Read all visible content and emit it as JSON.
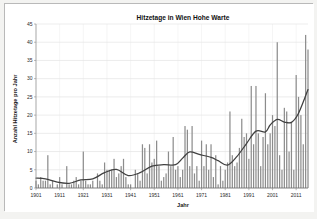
{
  "chart_data": {
    "type": "bar",
    "title": "Hitzetage in Wien Hohe Warte",
    "xlabel": "Jahr",
    "ylabel": "Anzahl Hitzetage pro Jahr",
    "ylim": [
      0,
      45
    ],
    "yticks": [
      0,
      5,
      10,
      15,
      20,
      25,
      30,
      35,
      40,
      45
    ],
    "xlim": [
      1901,
      2016
    ],
    "xticks": [
      1901,
      1911,
      1921,
      1931,
      1941,
      1951,
      1961,
      1971,
      1981,
      1991,
      2001,
      2011
    ],
    "grid": true,
    "legend": null,
    "bar_color": "#8c8c8c",
    "trend_color": "#404040",
    "series": [
      {
        "name": "Hitzetage pro Jahr",
        "type": "bar",
        "x": [
          1901,
          1902,
          1903,
          1904,
          1905,
          1906,
          1907,
          1908,
          1909,
          1910,
          1911,
          1912,
          1913,
          1914,
          1915,
          1916,
          1917,
          1918,
          1919,
          1920,
          1921,
          1922,
          1923,
          1924,
          1925,
          1926,
          1927,
          1928,
          1929,
          1930,
          1931,
          1932,
          1933,
          1934,
          1935,
          1936,
          1937,
          1938,
          1939,
          1940,
          1941,
          1942,
          1943,
          1944,
          1945,
          1946,
          1947,
          1948,
          1949,
          1950,
          1951,
          1952,
          1953,
          1954,
          1955,
          1956,
          1957,
          1958,
          1959,
          1960,
          1961,
          1962,
          1963,
          1964,
          1965,
          1966,
          1967,
          1968,
          1969,
          1970,
          1971,
          1972,
          1973,
          1974,
          1975,
          1976,
          1977,
          1978,
          1979,
          1980,
          1981,
          1982,
          1983,
          1984,
          1985,
          1986,
          1987,
          1988,
          1989,
          1990,
          1991,
          1992,
          1993,
          1994,
          1995,
          1996,
          1997,
          1998,
          1999,
          2000,
          2001,
          2002,
          2003,
          2004,
          2005,
          2006,
          2007,
          2008,
          2009,
          2010,
          2011,
          2012,
          2013,
          2014,
          2015,
          2016
        ],
        "values": [
          2,
          1,
          3,
          2,
          2,
          9,
          1,
          2,
          0,
          1,
          3,
          1,
          0,
          6,
          1,
          1,
          2,
          3,
          1,
          2,
          10,
          2,
          1,
          1,
          2,
          0,
          4,
          2,
          1,
          7,
          5,
          5,
          5,
          8,
          3,
          4,
          6,
          8,
          3,
          1,
          1,
          0,
          5,
          4,
          2,
          12,
          11,
          4,
          12,
          7,
          8,
          13,
          6,
          2,
          3,
          4,
          10,
          6,
          14,
          5,
          6,
          3,
          5,
          17,
          16,
          6,
          17,
          4,
          6,
          2,
          13,
          6,
          12,
          5,
          12,
          3,
          9,
          1,
          6,
          2,
          5,
          7,
          21,
          9,
          6,
          7,
          11,
          19,
          14,
          15,
          8,
          28,
          12,
          28,
          15,
          6,
          14,
          26,
          12,
          15,
          20,
          17,
          40,
          9,
          5,
          22,
          21,
          10,
          18,
          5,
          31,
          25,
          20,
          12,
          42,
          38
        ]
      },
      {
        "name": "geglätteter Trend",
        "type": "line",
        "x": [
          1901,
          1905,
          1910,
          1915,
          1920,
          1925,
          1930,
          1935,
          1940,
          1945,
          1950,
          1955,
          1960,
          1963,
          1966,
          1970,
          1975,
          1978,
          1982,
          1986,
          1990,
          1994,
          1998,
          2000,
          2003,
          2006,
          2009,
          2012,
          2016
        ],
        "values": [
          2.7,
          2.5,
          1.6,
          1.3,
          2.2,
          2.5,
          4.2,
          5.1,
          3.4,
          4.2,
          6.0,
          6.4,
          6.4,
          8.2,
          9.9,
          9.2,
          8.4,
          7.5,
          6.3,
          8.7,
          12.2,
          15.6,
          15.4,
          17.3,
          18.8,
          18.1,
          18.0,
          20.5,
          27.0
        ]
      }
    ]
  }
}
